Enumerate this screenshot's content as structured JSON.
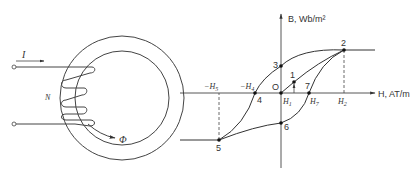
{
  "figure": {
    "left_panel": {
      "description": "Toroidal core with N-turn winding carrying current I producing flux Phi",
      "labels": {
        "current": "I",
        "turns": "N",
        "flux": "Φ"
      }
    },
    "right_panel": {
      "description": "B-H hysteresis loop",
      "y_axis_label": "B, Wb/m²",
      "x_axis_label": "H, AT/m",
      "points": [
        {
          "id": "O",
          "label": "O"
        },
        {
          "id": "1",
          "label": "1"
        },
        {
          "id": "2",
          "label": "2"
        },
        {
          "id": "3",
          "label": "3"
        },
        {
          "id": "4",
          "label": "4"
        },
        {
          "id": "5",
          "label": "5"
        },
        {
          "id": "6",
          "label": "6"
        },
        {
          "id": "7",
          "label": "7"
        }
      ],
      "h_ticks": {
        "neg_h5": {
          "sign": "−",
          "var": "H",
          "sub": "5"
        },
        "neg_h4": {
          "sign": "−",
          "var": "H",
          "sub": "4"
        },
        "h1": {
          "var": "H",
          "sub": "1"
        },
        "h7": {
          "var": "H",
          "sub": "7"
        },
        "h2": {
          "var": "H",
          "sub": "2"
        }
      }
    }
  }
}
